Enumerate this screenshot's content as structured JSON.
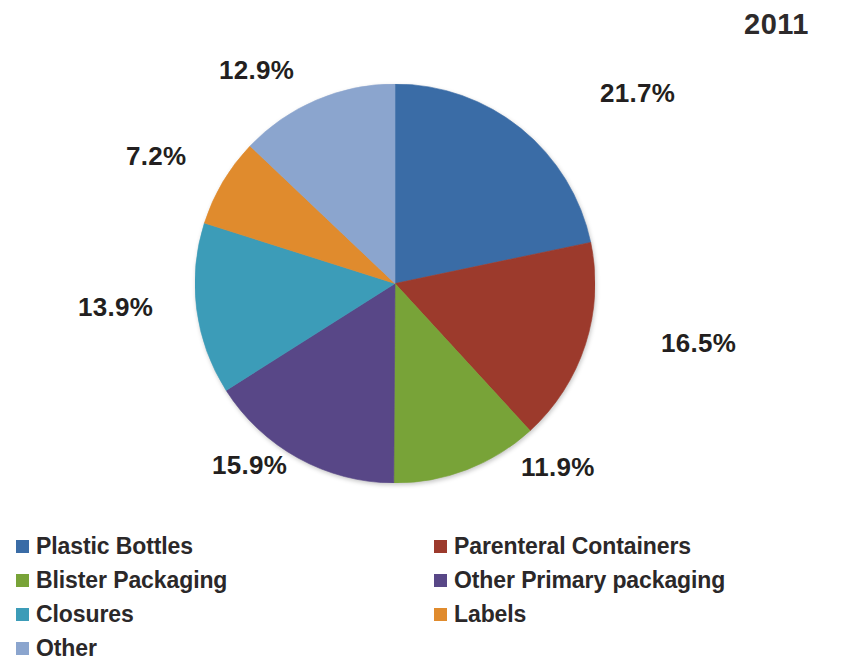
{
  "header": {
    "title": "2011"
  },
  "chart_data": {
    "type": "pie",
    "title": "2011",
    "subtitle": "",
    "xlabel": "",
    "ylabel": "",
    "grid": false,
    "legend_position": "bottom",
    "start_angle_deg": 0,
    "direction": "clockwise",
    "units": "percent",
    "categories": [
      "Plastic Bottles",
      "Parenteral Containers",
      "Blister Packaging",
      "Other Primary packaging",
      "Closures",
      "Labels",
      "Other"
    ],
    "values": [
      21.7,
      16.5,
      11.9,
      15.9,
      13.9,
      7.2,
      12.9
    ],
    "data_labels": [
      "21.7%",
      "16.5%",
      "11.9%",
      "15.9%",
      "13.9%",
      "7.2%",
      "12.9%"
    ],
    "colors": [
      "#3A6CA6",
      "#9C3A2C",
      "#78A338",
      "#584787",
      "#3C9CB8",
      "#E08B2D",
      "#8BA5CE"
    ],
    "slices": [
      {
        "label": "Plastic Bottles",
        "value": 21.7,
        "display": "21.7%",
        "color": "#3A6CA6"
      },
      {
        "label": "Parenteral Containers",
        "value": 16.5,
        "display": "16.5%",
        "color": "#9C3A2C"
      },
      {
        "label": "Blister Packaging",
        "value": 11.9,
        "display": "11.9%",
        "color": "#78A338"
      },
      {
        "label": "Other Primary packaging",
        "value": 15.9,
        "display": "15.9%",
        "color": "#584787"
      },
      {
        "label": "Closures",
        "value": 13.9,
        "display": "13.9%",
        "color": "#3C9CB8"
      },
      {
        "label": "Labels",
        "value": 7.2,
        "display": "7.2%",
        "color": "#E08B2D"
      },
      {
        "label": "Other",
        "value": 12.9,
        "display": "12.9%",
        "color": "#8BA5CE"
      }
    ]
  },
  "legend": {
    "left_column": [
      {
        "label": "Plastic Bottles",
        "color": "#3A6CA6"
      },
      {
        "label": "Blister Packaging",
        "color": "#78A338"
      },
      {
        "label": "Closures",
        "color": "#3C9CB8"
      },
      {
        "label": "Other",
        "color": "#8BA5CE"
      }
    ],
    "right_column": [
      {
        "label": "Parenteral Containers",
        "color": "#9C3A2C"
      },
      {
        "label": "Other Primary packaging",
        "color": "#584787"
      },
      {
        "label": "Labels",
        "color": "#E08B2D"
      }
    ]
  }
}
